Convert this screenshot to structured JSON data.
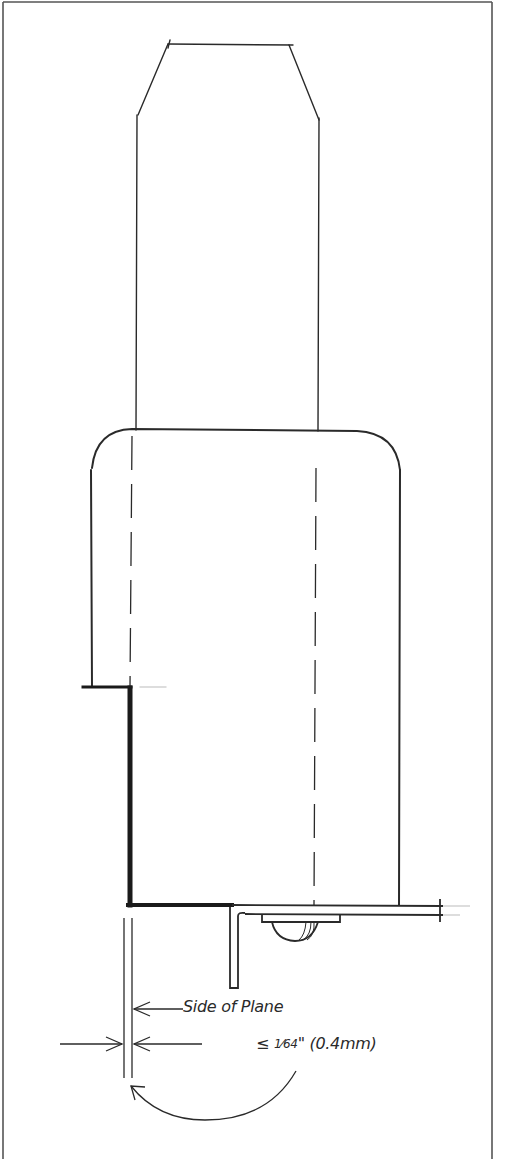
{
  "figure": {
    "type": "technical-drawing",
    "colors": {
      "ink": "#2a2a2a",
      "background": "#ffffff",
      "frame": "#555555"
    }
  },
  "labels": {
    "side_of_plane": "Side of Plane",
    "tolerance_symbol": "≤",
    "tolerance_fraction": "1⁄64",
    "tolerance_unit": "\"",
    "tolerance_metric": "(0.4mm)"
  },
  "annotations": [
    {
      "id": "side-arrow",
      "description": "Leader arrow pointing left to side of plane"
    },
    {
      "id": "gap-dimension",
      "description": "Opposed arrows indicating gap width"
    },
    {
      "id": "curved-arrow",
      "description": "Curved leader from tolerance text to gap"
    }
  ]
}
